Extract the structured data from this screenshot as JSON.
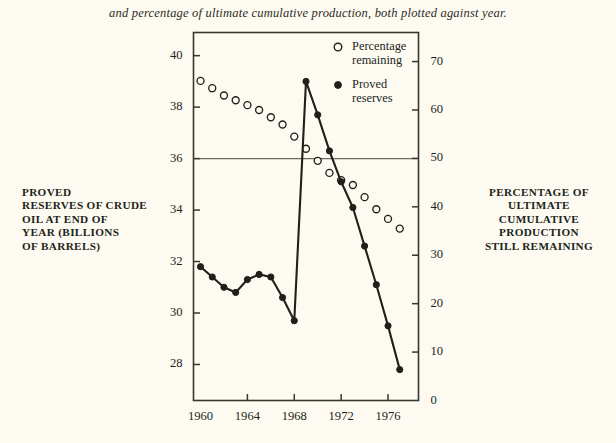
{
  "caption": "and percentage of ultimate cumulative production, both plotted against year.",
  "left_axis_title": [
    "PROVED",
    "RESERVES OF CRUDE",
    "OIL AT END OF",
    "YEAR (BILLIONS",
    "OF BARRELS)"
  ],
  "right_axis_title": [
    "PERCENTAGE OF",
    "ULTIMATE",
    "CUMULATIVE",
    "PRODUCTION",
    "STILL REMAINING"
  ],
  "colors": {
    "background": "#fdfbf1",
    "ink": "#221f1b",
    "frame": "#3a352e",
    "gridline": "#6e6a62"
  },
  "chart_data": {
    "type": "line",
    "title": "",
    "subtitle": "",
    "xlabel": "",
    "ylabel": "PROVED RESERVES OF CRUDE OIL AT END OF YEAR (BILLIONS OF BARRELS)",
    "y2label": "PERCENTAGE OF ULTIMATE CUMULATIVE PRODUCTION STILL REMAINING",
    "xlim": [
      1959.4,
      1978.6
    ],
    "ylim": [
      26.6,
      40.9
    ],
    "y2lim": [
      0,
      76
    ],
    "grid": false,
    "gridlines_horizontal": [
      36
    ],
    "xticks": [
      1960,
      1964,
      1968,
      1972,
      1976
    ],
    "xticklabels": [
      "1960",
      "1964",
      "1968",
      "1972",
      "1976"
    ],
    "yticks": [
      28,
      30,
      32,
      34,
      36,
      38,
      40
    ],
    "yticklabels": [
      "28",
      "30",
      "32",
      "34",
      "36",
      "38",
      "40"
    ],
    "y2ticks": [
      0,
      10,
      20,
      30,
      40,
      50,
      60,
      70
    ],
    "y2ticklabels": [
      "0",
      "10",
      "20",
      "30",
      "40",
      "50",
      "60",
      "70"
    ],
    "legend_position": "top-center",
    "series": [
      {
        "name": "Percentage remaining",
        "marker": "open-circle",
        "line": false,
        "axis": "right",
        "x": [
          1960,
          1961,
          1962,
          1963,
          1964,
          1965,
          1966,
          1967,
          1968,
          1969,
          1970,
          1971,
          1972,
          1973,
          1974,
          1975,
          1976,
          1977
        ],
        "values": [
          66.0,
          64.5,
          63.0,
          62.0,
          61.0,
          60.0,
          58.5,
          57.0,
          54.5,
          52.0,
          49.5,
          47.0,
          45.5,
          44.5,
          42.0,
          39.5,
          37.5,
          35.5
        ]
      },
      {
        "name": "Proved reserves",
        "marker": "filled-circle",
        "line": true,
        "axis": "left",
        "x": [
          1960,
          1961,
          1962,
          1963,
          1964,
          1965,
          1966,
          1967,
          1968,
          1969,
          1970,
          1971,
          1972,
          1973,
          1974,
          1975,
          1976,
          1977
        ],
        "values": [
          31.8,
          31.4,
          31.0,
          30.8,
          31.3,
          31.5,
          31.4,
          30.6,
          29.7,
          39.0,
          37.7,
          36.3,
          35.1,
          34.1,
          32.6,
          31.1,
          29.5,
          27.8
        ]
      }
    ],
    "legend": [
      {
        "label_lines": [
          "Percentage",
          "remaining"
        ],
        "marker": "open-circle"
      },
      {
        "label_lines": [
          "Proved",
          "reserves"
        ],
        "marker": "filled-circle"
      }
    ]
  }
}
